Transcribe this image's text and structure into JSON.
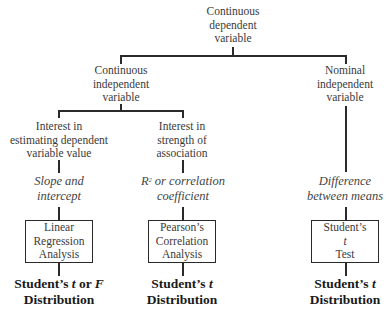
{
  "diagram": {
    "root": {
      "lines": [
        "Continuous",
        "dependent",
        "variable"
      ]
    },
    "branches": {
      "continuous_independent": {
        "lines": [
          "Continuous",
          "independent",
          "variable"
        ]
      },
      "nominal_independent": {
        "lines": [
          "Nominal",
          "independent",
          "variable"
        ]
      }
    },
    "leaves": [
      {
        "interest": [
          "Interest in",
          "estimating dependent",
          "variable value"
        ],
        "measure": [
          "Slope and",
          "intercept"
        ],
        "method": [
          "Linear",
          "Regression",
          "Analysis"
        ],
        "distribution_line1_pre": "Student’s ",
        "distribution_t": "t",
        "distribution_mid": " or ",
        "distribution_f": "F",
        "distribution_line2": "Distribution"
      },
      {
        "interest": [
          "Interest in",
          "strength of",
          "association"
        ],
        "measure_r": "R",
        "measure_sup": "2",
        "measure_rest": " or correlation",
        "measure_line2": "coefficient",
        "method": [
          "Pearson’s",
          "Correlation",
          "Analysis"
        ],
        "distribution_line1_pre": "Student’s ",
        "distribution_t": "t",
        "distribution_line2": "Distribution"
      },
      {
        "measure": [
          "Difference",
          "between means"
        ],
        "method": [
          "Student’s",
          "t",
          "Test"
        ],
        "distribution_line1_pre": "Student’s ",
        "distribution_t": "t",
        "distribution_line2": "Distribution"
      }
    ]
  }
}
